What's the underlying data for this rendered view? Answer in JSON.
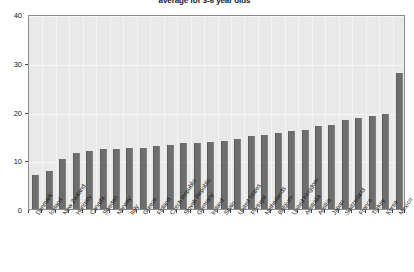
{
  "chart": {
    "title": "average for 3-6 year olds",
    "xlabel": "",
    "ylabel": "",
    "bar_color": "#6e6e6e",
    "plot_background": "#e9e9e9",
    "axis_color": "#8c8c8c"
  },
  "axis": {
    "y_ticks": [
      "0",
      "10",
      "20",
      "30",
      "40"
    ],
    "x_tick_count": 31
  },
  "chart_data": {
    "type": "bar",
    "title": "average for 3-6 year olds",
    "xlabel": "",
    "ylabel": "",
    "ylim": [
      0,
      40
    ],
    "yticks": [
      0,
      10,
      20,
      30,
      40
    ],
    "grid": true,
    "legend": "none",
    "categories": [
      "Denmark",
      "Iceland",
      "New Zealand",
      "Hungary",
      "Canada",
      "Sweden",
      "Norway",
      "Italy",
      "Greece",
      "Finland",
      "Czech Republic",
      "Slovak Republic",
      "Germany",
      "Ireland",
      "Spain",
      "United States",
      "Portugal",
      "Netherlands",
      "Belgium",
      "United Kingdom",
      "Australia",
      "Austria",
      "Japan",
      "Switzerland",
      "France",
      "Turkey",
      "Korea",
      "Mexico"
    ],
    "values": [
      7.0,
      7.8,
      10.2,
      11.5,
      12.0,
      12.3,
      12.4,
      12.5,
      12.6,
      13.0,
      13.2,
      13.5,
      13.6,
      13.8,
      14.0,
      14.4,
      15.0,
      15.2,
      15.6,
      16.0,
      16.2,
      17.0,
      17.2,
      18.2,
      18.6,
      19.0,
      19.4,
      28.0
    ]
  }
}
